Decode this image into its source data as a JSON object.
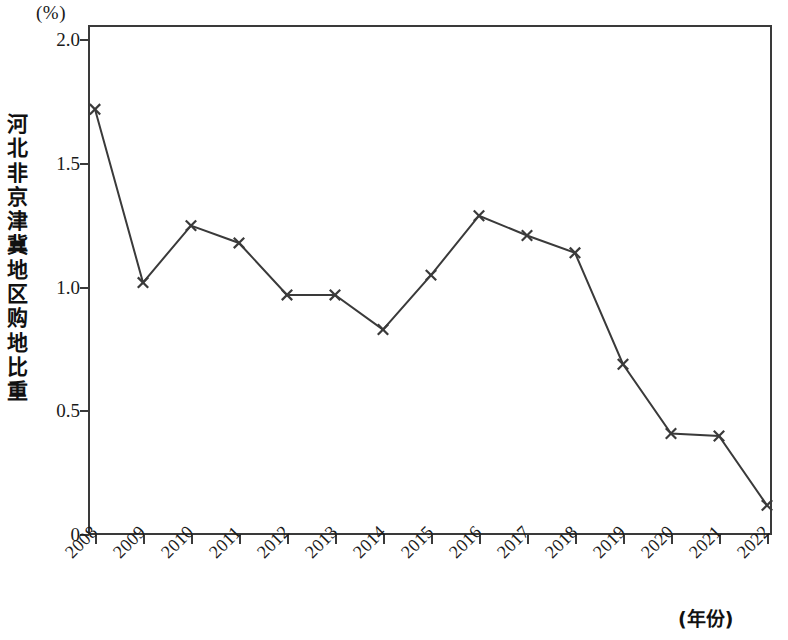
{
  "chart_data": {
    "type": "line",
    "title": "",
    "subtitle": "",
    "xlabel": "(年份)",
    "ylabel": "河北非京津冀地区购地比重",
    "y_unit": "(%)",
    "grid": false,
    "legend_position": "none",
    "marker": "x-cross",
    "line_color": "#3a3a3a",
    "categories": [
      "2008",
      "2009",
      "2010",
      "2011",
      "2012",
      "2013",
      "2014",
      "2015",
      "2016",
      "2017",
      "2018",
      "2019",
      "2020",
      "2021",
      "2022"
    ],
    "values": [
      1.72,
      1.02,
      1.25,
      1.18,
      0.97,
      0.97,
      0.83,
      1.05,
      1.29,
      1.21,
      1.14,
      0.69,
      0.41,
      0.4,
      0.12
    ],
    "series": [
      {
        "name": "河北非京津冀地区购地比重",
        "values": [
          1.72,
          1.02,
          1.25,
          1.18,
          0.97,
          0.97,
          0.83,
          1.05,
          1.29,
          1.21,
          1.14,
          0.69,
          0.41,
          0.4,
          0.12
        ]
      }
    ],
    "xlim": [
      2008,
      2022
    ],
    "ylim": [
      0,
      2.05
    ],
    "ytick_labels": [
      "2.0",
      "1.5",
      "1.0",
      "0.5",
      "0"
    ],
    "ytick_values": [
      2.0,
      1.5,
      1.0,
      0.5,
      0
    ],
    "xtick_labels": [
      "2008",
      "2009",
      "2010",
      "2011",
      "2012",
      "2013",
      "2014",
      "2015",
      "2016",
      "2017",
      "2018",
      "2019",
      "2020",
      "2021",
      "2022"
    ]
  },
  "axis": {
    "y_unit_label": "(%)",
    "y_title": "河北非京津冀地区购地比重",
    "x_unit_label": "(年份)"
  }
}
